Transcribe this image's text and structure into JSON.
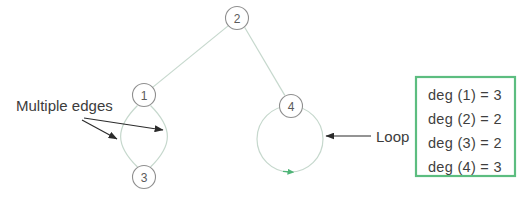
{
  "figure": {
    "background_color": "#ffffff"
  },
  "colors": {
    "edge": "#c6d8cd",
    "node_stroke": "#8f8f8f",
    "node_label": "#5b5b5b",
    "annotation": "#3c3c3c",
    "arrow": "#2b2b2b",
    "legend_border": "#5cbd80",
    "loop_arrowhead": "#4fb477"
  },
  "graph": {
    "nodes": [
      {
        "id": "1",
        "label": "1",
        "cx": 144,
        "cy": 95,
        "r": 11.5
      },
      {
        "id": "2",
        "label": "2",
        "cx": 237,
        "cy": 18,
        "r": 11.5
      },
      {
        "id": "3",
        "label": "3",
        "cx": 144,
        "cy": 177,
        "r": 11.5
      },
      {
        "id": "4",
        "label": "4",
        "cx": 291,
        "cy": 106,
        "r": 11.5
      }
    ],
    "edges": [
      {
        "from": "2",
        "to": "1",
        "type": "straight"
      },
      {
        "from": "2",
        "to": "4",
        "type": "straight"
      },
      {
        "from": "1",
        "to": "3",
        "type": "curve-left"
      },
      {
        "from": "1",
        "to": "3",
        "type": "curve-right"
      },
      {
        "from": "4",
        "to": "4",
        "type": "loop"
      }
    ]
  },
  "annotations": [
    {
      "id": "multiple-edges",
      "label": "Multiple edges",
      "text_x": 16,
      "text_y": 105,
      "arrows": [
        {
          "x1": 82,
          "y1": 120,
          "x2": 117,
          "y2": 139
        },
        {
          "x1": 84,
          "y1": 118,
          "x2": 163,
          "y2": 130
        }
      ]
    },
    {
      "id": "loop",
      "label": "Loop",
      "text_x": 376,
      "text_y": 136,
      "arrows": [
        {
          "x1": 371,
          "y1": 136,
          "x2": 326,
          "y2": 136
        }
      ]
    }
  ],
  "legend": {
    "box": {
      "x": 416,
      "y": 77,
      "width": 99,
      "height": 99
    },
    "entries": [
      {
        "label": "deg (1) = 3",
        "node": "1",
        "degree": 3
      },
      {
        "label": "deg (2) = 2",
        "node": "2",
        "degree": 2
      },
      {
        "label": "deg (3) = 2",
        "node": "3",
        "degree": 2
      },
      {
        "label": "deg (4) = 3",
        "node": "4",
        "degree": 3
      }
    ]
  }
}
